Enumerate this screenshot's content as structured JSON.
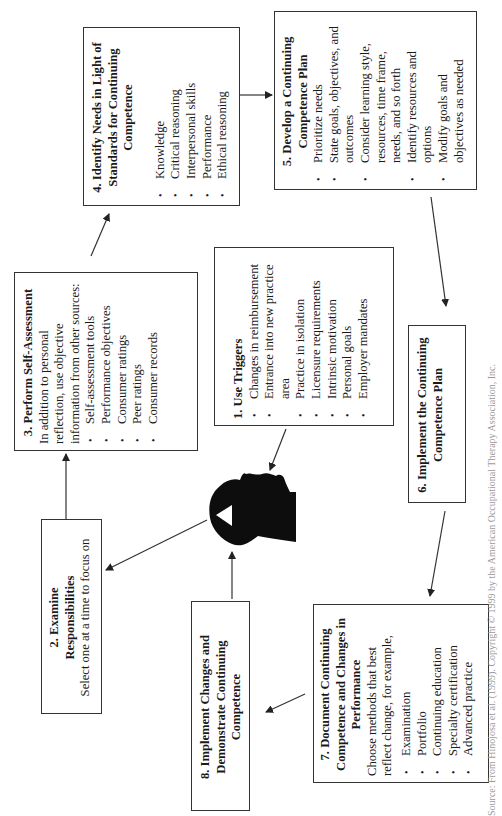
{
  "diagram": {
    "steps": [
      {
        "id": 1,
        "title": "1. Use Triggers",
        "items": [
          "Changes in reimbursement",
          "Entrance into new practice area",
          "Practice in isolation",
          "Licensure requirements",
          "Intrinsic motivation",
          "Personal goals",
          "Employer mandates"
        ]
      },
      {
        "id": 2,
        "title": "2. Examine Responsibilities",
        "description": "Select one at a time to focus on"
      },
      {
        "id": 3,
        "title": "3. Perform Self-Assessment",
        "description": "In addition to personal reflection, use objective information from other sources:",
        "items": [
          "Self-assessment tools",
          "Performance objectives",
          "Consumer ratings",
          "Peer ratings",
          "Consumer records"
        ]
      },
      {
        "id": 4,
        "title": "4. Identify Needs in Light of Standards for Continuing Competence",
        "items": [
          "Knowledge",
          "Critical reasoning",
          "Interpersonal skills",
          "Performance",
          "Ethical reasoning"
        ]
      },
      {
        "id": 5,
        "title": "5. Develop a Continuing Competence Plan",
        "items": [
          "Prioritize needs",
          "State goals, objectives, and outcomes",
          "Consider learning style, resources, time frame, needs, and so forth",
          "Identify resources and options",
          "Modify goals and objectives as needed"
        ]
      },
      {
        "id": 6,
        "title": "6. Implement the Continuing Competence Plan"
      },
      {
        "id": 7,
        "title": "7. Document Continuing Competence and Changes in Performance",
        "description": "Choose methods that best reflect change, for example,",
        "items": [
          "Examination",
          "Portfolio",
          "Continuing education",
          "Specialty certification",
          "Advanced practice"
        ]
      },
      {
        "id": 8,
        "title": "8. Implement Changes and Demonstrate Continuing Competence"
      }
    ],
    "center_icon": "human-head-silhouette-icon",
    "flow": [
      "1 -> head",
      "head -> 2",
      "2 -> 3",
      "3 -> 4",
      "4 -> 5",
      "5 -> 6",
      "6 -> 7",
      "7 -> 8",
      "8 -> head"
    ],
    "caption": "Source: From Hinojosa et al. (1999). Copyright © 1999 by the American Occupational Therapy Association, Inc."
  },
  "colors": {
    "stroke": "#333333",
    "text": "#1a1a1a",
    "head": "#0d0d0d",
    "caption": "#9a9a9a"
  }
}
